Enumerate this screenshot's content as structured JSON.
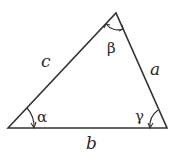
{
  "diagram": {
    "type": "triangle",
    "colors": {
      "stroke": "#333333",
      "text": "#2a2a2a",
      "background": "#ffffff"
    },
    "sides": {
      "a": "a",
      "b": "b",
      "c": "c"
    },
    "angles": {
      "alpha": "α",
      "beta": "β",
      "gamma": "γ"
    }
  }
}
